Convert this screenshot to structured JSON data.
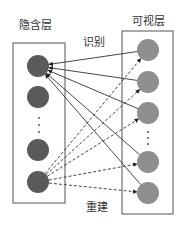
{
  "labels": {
    "hidden_layer": "隐含层",
    "visible_layer": "可视层",
    "recognition": "识别",
    "reconstruction": "重建"
  },
  "caption": "",
  "colors": {
    "hidden_node": "#5a5a5a",
    "visible_node": "#8f8f8f",
    "edge": "#333333",
    "box": "#555555"
  },
  "hidden_layer": {
    "box": {
      "x": 13,
      "y": 43,
      "w": 52,
      "h": 160
    },
    "nodes": [
      {
        "cx": 38,
        "cy": 66
      },
      {
        "cx": 38,
        "cy": 97
      },
      {
        "cx": 38,
        "cy": 150
      },
      {
        "cx": 38,
        "cy": 182
      }
    ],
    "ellipsis_dots_y": [
      118,
      125,
      132
    ],
    "ellipsis_x": 39
  },
  "visible_layer": {
    "box": {
      "x": 122,
      "y": 31,
      "w": 51,
      "h": 183
    },
    "nodes": [
      {
        "cx": 148,
        "cy": 50
      },
      {
        "cx": 148,
        "cy": 82
      },
      {
        "cx": 148,
        "cy": 113
      },
      {
        "cx": 148,
        "cy": 162
      },
      {
        "cx": 148,
        "cy": 193
      }
    ],
    "ellipsis_dots_y": [
      132,
      138,
      144
    ],
    "ellipsis_x": 148
  },
  "edges": {
    "recognition_solid": {
      "from_hidden": 0,
      "to_visible": [
        0,
        1,
        2,
        3,
        4
      ],
      "arrow_at": "hidden"
    },
    "reconstruction_dashed": {
      "from_hidden": 3,
      "to_visible": [
        0,
        1,
        2,
        3,
        4
      ],
      "arrow_at": "visible"
    }
  },
  "node_radius": 11
}
